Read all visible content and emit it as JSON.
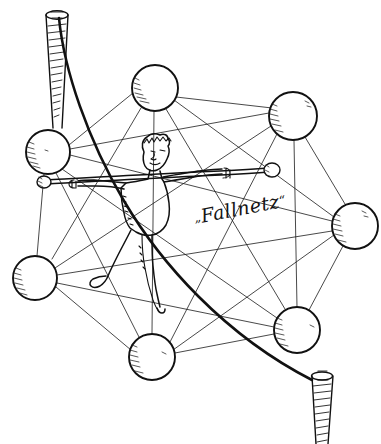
{
  "illustration": {
    "title": "Fallnetz",
    "caption": {
      "open_quote": "„",
      "text": "Fallnetz",
      "close_quote": "“"
    },
    "background_color": "#ffffff",
    "ink_color": "#111111",
    "style": "hand-drawn pen sketch",
    "subject": "tightrope walker balancing on a rope stretched across a safety net of linked spheres"
  },
  "nodes": [
    {
      "id": "node-top",
      "label": "top node",
      "cx": 155,
      "cy": 88,
      "r": 23
    },
    {
      "id": "node-upper-right",
      "label": "upper right node",
      "cx": 293,
      "cy": 116,
      "r": 24
    },
    {
      "id": "node-left",
      "label": "left node",
      "cx": 48,
      "cy": 152,
      "r": 22
    },
    {
      "id": "node-right",
      "label": "right node",
      "cx": 355,
      "cy": 226,
      "r": 23
    },
    {
      "id": "node-lower-left",
      "label": "lower left node",
      "cx": 35,
      "cy": 278,
      "r": 22
    },
    {
      "id": "node-lower-right",
      "label": "lower right node",
      "cx": 297,
      "cy": 330,
      "r": 23
    },
    {
      "id": "node-bottom",
      "label": "bottom node",
      "cx": 152,
      "cy": 357,
      "r": 23
    }
  ],
  "edges": [
    [
      "node-top",
      "node-upper-right"
    ],
    [
      "node-top",
      "node-left"
    ],
    [
      "node-top",
      "node-right"
    ],
    [
      "node-top",
      "node-lower-left"
    ],
    [
      "node-top",
      "node-lower-right"
    ],
    [
      "node-top",
      "node-bottom"
    ],
    [
      "node-upper-right",
      "node-left"
    ],
    [
      "node-upper-right",
      "node-right"
    ],
    [
      "node-upper-right",
      "node-lower-left"
    ],
    [
      "node-upper-right",
      "node-lower-right"
    ],
    [
      "node-upper-right",
      "node-bottom"
    ],
    [
      "node-left",
      "node-right"
    ],
    [
      "node-left",
      "node-lower-left"
    ],
    [
      "node-left",
      "node-lower-right"
    ],
    [
      "node-left",
      "node-bottom"
    ],
    [
      "node-right",
      "node-lower-left"
    ],
    [
      "node-right",
      "node-lower-right"
    ],
    [
      "node-right",
      "node-bottom"
    ],
    [
      "node-lower-left",
      "node-lower-right"
    ],
    [
      "node-lower-left",
      "node-bottom"
    ],
    [
      "node-lower-right",
      "node-bottom"
    ]
  ],
  "anchors": [
    {
      "id": "screw-top-left",
      "label": "upper left screw",
      "x": 57,
      "y": 14,
      "orientation": "points-down"
    },
    {
      "id": "screw-bottom-right",
      "label": "lower right screw",
      "x": 322,
      "y": 373,
      "orientation": "points-down"
    }
  ],
  "rope": {
    "label": "tightrope",
    "from_anchor": "screw-top-left",
    "to_anchor": "screw-bottom-right",
    "shape": "slack catenary curve sagging to the lower left"
  },
  "figure": {
    "label": "tightrope walker",
    "pose": "standing on rope, arms out holding a balance pole",
    "balance_pole": {
      "label": "balance pole",
      "left_end": {
        "x": 46,
        "y": 180
      },
      "right_end": {
        "x": 270,
        "y": 168
      },
      "end_weights": 2
    }
  }
}
